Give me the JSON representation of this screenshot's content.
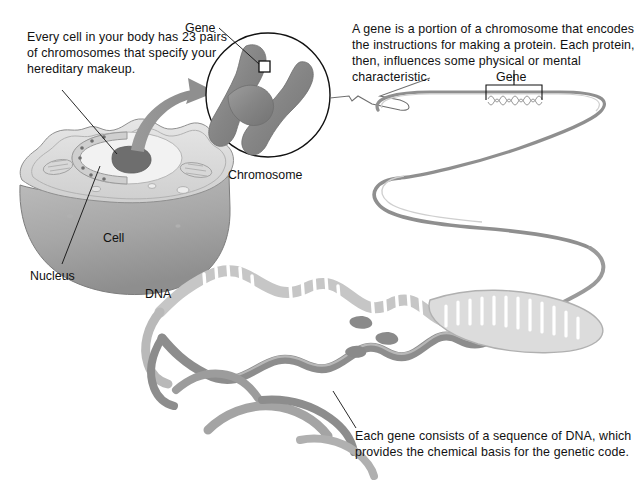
{
  "figure": {
    "background_color": "#ffffff",
    "ink_color": "#111111",
    "art_gray_dark": "#7e7e7e",
    "art_gray_mid": "#9b9b9b",
    "art_gray_light": "#c9c9c9",
    "art_gray_pale": "#e2e2e2"
  },
  "captions": {
    "cell_caption": "Every cell in your body has 23 pairs of chromosomes that specify your hereditary makeup.",
    "gene_definition": "A gene is a portion of a chromosome that encodes the instructions for making a protein. Each protein, then, influences some physical or mental characteristic.",
    "dna_sequence_caption": "Each gene consists of a sequence of DNA, which provides the chemical basis for the genetic code."
  },
  "labels": {
    "gene_on_chromosome": "Gene",
    "chromosome": "Chromosome",
    "gene_on_dna": "Gene",
    "cell": "Cell",
    "nucleus": "Nucleus",
    "dna": "DNA"
  },
  "annotations": {
    "chromosome_count": "23 pairs",
    "structures": [
      "Cell",
      "Nucleus",
      "Chromosome",
      "Gene",
      "DNA"
    ]
  }
}
